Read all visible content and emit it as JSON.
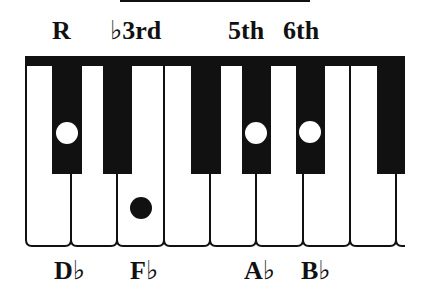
{
  "diagram": {
    "interval_labels": [
      {
        "text": "R",
        "x": 52,
        "y": 18
      },
      {
        "text": "♭3rd",
        "x": 110,
        "y": 18
      },
      {
        "text": "5th",
        "x": 228,
        "y": 18
      },
      {
        "text": "6th",
        "x": 283,
        "y": 18
      }
    ],
    "note_labels": [
      {
        "text": "D♭",
        "x": 54,
        "y": 258
      },
      {
        "text": "F♭",
        "x": 130,
        "y": 258
      },
      {
        "text": "A♭",
        "x": 244,
        "y": 258
      },
      {
        "text": "B♭",
        "x": 301,
        "y": 258
      }
    ],
    "keyboard": {
      "top_bar": {
        "x": 26,
        "y": 56,
        "width": 379,
        "height": 10
      },
      "white_key_lines": [
        26,
        71,
        117,
        164,
        210,
        256,
        303,
        350,
        396
      ],
      "white_key_bottom": 246,
      "black_keys": [
        {
          "x": 52,
          "width": 30
        },
        {
          "x": 103,
          "width": 29
        },
        {
          "x": 191,
          "width": 30
        },
        {
          "x": 242,
          "width": 29
        },
        {
          "x": 296,
          "width": 29
        },
        {
          "x": 377,
          "width": 28
        }
      ],
      "black_key_bottom": 174
    },
    "markers": [
      {
        "note": "D♭",
        "role": "R",
        "type": "white-dot-on-black-key",
        "cx": 67,
        "cy": 133,
        "r": 11
      },
      {
        "note": "F♭",
        "role": "♭3rd",
        "type": "black-dot-on-white-key",
        "cx": 141,
        "cy": 208,
        "r": 11
      },
      {
        "note": "A♭",
        "role": "5th",
        "type": "white-dot-on-black-key",
        "cx": 256,
        "cy": 133,
        "r": 11
      },
      {
        "note": "B♭",
        "role": "6th",
        "type": "white-dot-on-black-key",
        "cx": 310,
        "cy": 132,
        "r": 11
      }
    ],
    "colors": {
      "ink": "#111111",
      "paper": "#ffffff"
    }
  }
}
